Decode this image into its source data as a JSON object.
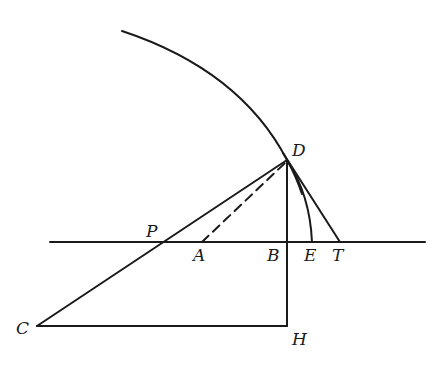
{
  "diagram": {
    "type": "geometric construction",
    "labels": {
      "D": "D",
      "P": "P",
      "A": "A",
      "B": "B",
      "E": "E",
      "T": "T",
      "C": "C",
      "H": "H"
    },
    "points": {
      "D": [
        287,
        160
      ],
      "P": [
        160,
        242
      ],
      "A": [
        202,
        242
      ],
      "B": [
        287,
        242
      ],
      "E": [
        312,
        242
      ],
      "T": [
        340,
        242
      ],
      "C": [
        37,
        326
      ],
      "H": [
        287,
        326
      ]
    },
    "segments": [
      {
        "from": "C",
        "to": "D",
        "style": "solid",
        "passes_through": "P"
      },
      {
        "from": "A",
        "to": "D",
        "style": "dashed"
      },
      {
        "from": "D",
        "to": "H",
        "style": "solid",
        "passes_through": "B"
      },
      {
        "from": "D",
        "to": "T",
        "style": "solid"
      },
      {
        "from": "C",
        "to": "H",
        "style": "solid"
      },
      {
        "from": "baseline-left",
        "to": "baseline-right",
        "style": "solid"
      }
    ],
    "arcs": [
      {
        "name": "large-arc",
        "center": "C",
        "through": "D"
      },
      {
        "name": "small-arc",
        "from": "D",
        "to": "E"
      }
    ],
    "line_color": "#1a1a1a",
    "background": "#ffffff"
  }
}
